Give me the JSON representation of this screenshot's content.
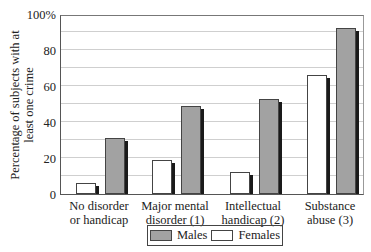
{
  "chart_data": {
    "type": "bar",
    "title": "",
    "xlabel": "",
    "ylabel": "Percentage of subjects with at least one crime",
    "ylabel_lines": [
      "Percentage of subjects with at",
      "least one crime"
    ],
    "ylim": [
      0,
      100
    ],
    "yticks": [
      "0",
      "20",
      "40",
      "60",
      "80",
      "100%"
    ],
    "ytick_values": [
      0,
      20,
      40,
      60,
      80,
      100
    ],
    "grid": true,
    "grid_step": 10,
    "categories": [
      "No disorder or handicap",
      "Major mental disorder (1)",
      "Intellectual handicap (2)",
      "Substance abuse (3)"
    ],
    "category_lines": [
      [
        "No disorder",
        "or handicap"
      ],
      [
        "Major mental",
        "disorder (1)"
      ],
      [
        "Intellectual",
        "handicap (2)"
      ],
      [
        "Substance",
        "abuse (3)"
      ]
    ],
    "series": [
      {
        "name": "Males",
        "color": "#a2a2a2",
        "values": [
          31,
          49,
          53,
          92
        ]
      },
      {
        "name": "Females",
        "color": "#ffffff",
        "values": [
          6,
          19,
          12,
          66
        ]
      }
    ],
    "legend_position": "bottom-center"
  },
  "legend": {
    "males_label": "Males",
    "females_label": "Females"
  }
}
